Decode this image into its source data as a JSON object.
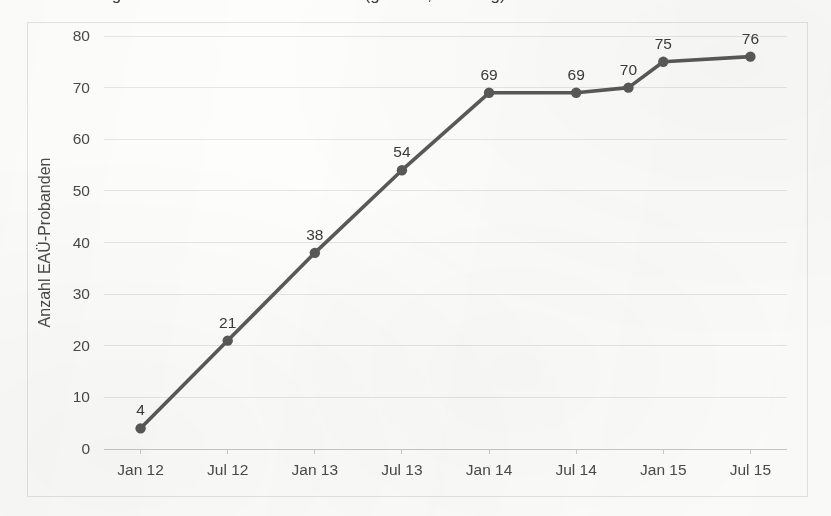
{
  "caption": {
    "text": "Abbildung 1: Anzahl der EAÜ-Probanden (gesamt, Stichtag)"
  },
  "chart_data": {
    "type": "line",
    "title": "",
    "xlabel": "",
    "ylabel": "Anzahl EAÜ-Probanden",
    "categories": [
      "Jan 12",
      "Jul 12",
      "Jan 13",
      "Jul 13",
      "Jan 14",
      "Jul 14",
      "Okt 14",
      "Jan 15",
      "Jul 15"
    ],
    "tick_labels": [
      "Jan 12",
      "Jul 12",
      "Jan 13",
      "Jul 13",
      "Jan 14",
      "Jul 14",
      "Jan 15",
      "Jul 15"
    ],
    "x_positions": [
      0,
      1,
      2,
      3,
      4,
      5,
      5.6,
      6,
      7
    ],
    "values": [
      4,
      21,
      38,
      54,
      69,
      69,
      70,
      75,
      76
    ],
    "point_labels": [
      "4",
      "21",
      "38",
      "54",
      "69",
      "69",
      "70",
      "75",
      "76"
    ],
    "ylim": [
      0,
      80
    ],
    "ytick_values": [
      0,
      10,
      20,
      30,
      40,
      50,
      60,
      70,
      80
    ],
    "ytick_labels": [
      "0",
      "10",
      "20",
      "30",
      "40",
      "50",
      "60",
      "70",
      "80"
    ],
    "xlim": [
      -0.42,
      7.42
    ],
    "grid": true,
    "grid_axis": "y",
    "legend": false,
    "series_color": "#595959",
    "marker_color": "#595959",
    "grid_color": "#e6e6e6",
    "axis_color": "#c9c9c9",
    "text_color": "#4a4a4a",
    "background_color": "#fdfdfc",
    "border_color": "#e3e3e3"
  }
}
